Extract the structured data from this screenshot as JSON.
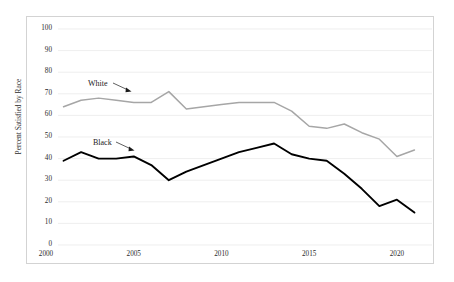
{
  "chart_data": {
    "type": "line",
    "title": "",
    "xlabel": "",
    "ylabel": "Percent Satisfied by Race",
    "xlim": [
      2000,
      2022
    ],
    "ylim": [
      0,
      100
    ],
    "ytick_labels": [
      "100",
      "90",
      "80",
      "70",
      "60",
      "50",
      "40",
      "30",
      "20",
      "10",
      "0"
    ],
    "ytick_values": [
      100,
      90,
      80,
      70,
      60,
      50,
      40,
      30,
      20,
      10,
      0
    ],
    "xtick_labels": [
      "2000",
      "2005",
      "2010",
      "2015",
      "2020"
    ],
    "xtick_values": [
      2000,
      2005,
      2010,
      2015,
      2020
    ],
    "grid": "horizontal",
    "legend_position": "inline-annotations",
    "x": [
      2001,
      2002,
      2003,
      2004,
      2005,
      2006,
      2007,
      2008,
      2009,
      2010,
      2011,
      2012,
      2013,
      2014,
      2015,
      2016,
      2017,
      2018,
      2019,
      2020,
      2021
    ],
    "series": [
      {
        "name": "White",
        "color": "#a6a6a6",
        "values": [
          64,
          67,
          68,
          67,
          66,
          66,
          71,
          63,
          64,
          65,
          66,
          66,
          66,
          62,
          55,
          54,
          56,
          52,
          49,
          41,
          44
        ]
      },
      {
        "name": "Black",
        "color": "#000000",
        "values": [
          39,
          43,
          40,
          40,
          41,
          37,
          30,
          34,
          37,
          40,
          43,
          45,
          47,
          42,
          40,
          39,
          33,
          26,
          18,
          21,
          15
        ]
      }
    ],
    "annotations": [
      {
        "text": "White",
        "series": "White",
        "arrow": true
      },
      {
        "text": "Black",
        "series": "Black",
        "arrow": true
      }
    ]
  }
}
